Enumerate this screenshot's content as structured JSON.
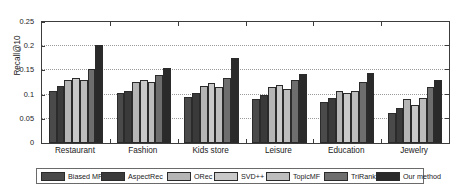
{
  "chart_data": {
    "type": "bar",
    "title": "",
    "xlabel": "",
    "ylabel": "Recall@10",
    "ylim": [
      0,
      0.25
    ],
    "yticks": [
      "0",
      "0.05",
      "0.1",
      "0.15",
      "0.2",
      "0.25"
    ],
    "ytick_values": [
      0,
      0.05,
      0.1,
      0.15,
      0.2,
      0.25
    ],
    "grid": true,
    "legend_position": "bottom",
    "categories": [
      "Restaurant",
      "Fashion",
      "Kids store",
      "Leisure",
      "Education",
      "Jewelry"
    ],
    "series": [
      {
        "name": "Biased MF",
        "color": "#4a4a4a",
        "values": [
          0.107,
          0.103,
          0.095,
          0.091,
          0.085,
          0.063
        ]
      },
      {
        "name": "AspectRec",
        "color": "#3a3a3a",
        "values": [
          0.118,
          0.108,
          0.104,
          0.099,
          0.093,
          0.072
        ]
      },
      {
        "name": "ORec",
        "color": "#b5b5b5",
        "values": [
          0.131,
          0.126,
          0.118,
          0.115,
          0.108,
          0.09
        ]
      },
      {
        "name": "SVD++",
        "color": "#c9c9c9",
        "values": [
          0.135,
          0.131,
          0.123,
          0.12,
          0.104,
          0.079
        ]
      },
      {
        "name": "TopicMF",
        "color": "#bdbdbd",
        "values": [
          0.131,
          0.127,
          0.116,
          0.112,
          0.107,
          0.092
        ]
      },
      {
        "name": "TriRank",
        "color": "#6e6e6e",
        "values": [
          0.152,
          0.141,
          0.135,
          0.131,
          0.127,
          0.116
        ]
      },
      {
        "name": "Our method",
        "color": "#2a2a2a",
        "values": [
          0.203,
          0.155,
          0.175,
          0.142,
          0.144,
          0.131
        ]
      }
    ]
  },
  "axis": {
    "y_title": "Recall@10"
  },
  "legend": {
    "items": [
      {
        "label": "Biased MF"
      },
      {
        "label": "AspectRec"
      },
      {
        "label": "ORec"
      },
      {
        "label": "SVD++"
      },
      {
        "label": "TopicMF"
      },
      {
        "label": "TriRank"
      },
      {
        "label": "Our method"
      }
    ]
  }
}
